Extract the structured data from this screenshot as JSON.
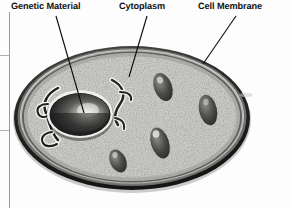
{
  "figure": {
    "kind": "cell-diagram",
    "medium": "grayscale scanned textbook illustration",
    "background_color": "#fdfdfd"
  },
  "labels": [
    {
      "id": "genetic-material",
      "text": "Genetic Material",
      "x": 11,
      "y": 2,
      "leader": {
        "from_x": 56,
        "from_y": 16,
        "to_x": 84,
        "to_y": 113
      }
    },
    {
      "id": "cytoplasm",
      "text": "Cytoplasm",
      "x": 119,
      "y": 2,
      "leader": {
        "from_x": 147,
        "from_y": 16,
        "to_x": 129,
        "to_y": 77
      }
    },
    {
      "id": "cell-membrane",
      "text": "Cell Membrane",
      "x": 198,
      "y": 2,
      "leader": {
        "from_x": 236,
        "from_y": 16,
        "to_x": 203,
        "to_y": 64
      }
    }
  ],
  "structures": {
    "cell_body": {
      "name": "cell",
      "cx": 132,
      "cy": 118,
      "rx": 118,
      "ry": 73,
      "membrane_color": "#2b2b2b",
      "cytoplasm_color": "#b9b9b6"
    },
    "nucleus": {
      "name": "nucleus",
      "cx": 80,
      "cy": 114,
      "rx": 31,
      "ry": 22,
      "color": "#3a3a3a",
      "highlight_color": "#e8e8e4"
    },
    "er_left": {
      "name": "endoplasmic-reticulum-left",
      "cx": 46,
      "cy": 120
    },
    "er_right": {
      "name": "endoplasmic-reticulum-right",
      "cx": 117,
      "cy": 105
    },
    "organelles": [
      {
        "name": "mitochondrion",
        "cx": 163,
        "cy": 87,
        "rx": 9,
        "ry": 14,
        "rot": -20
      },
      {
        "name": "mitochondrion",
        "cx": 208,
        "cy": 110,
        "rx": 9,
        "ry": 15,
        "rot": -12
      },
      {
        "name": "mitochondrion",
        "cx": 160,
        "cy": 143,
        "rx": 9,
        "ry": 16,
        "rot": -18
      },
      {
        "name": "mitochondrion",
        "cx": 118,
        "cy": 160,
        "rx": 8,
        "ry": 12,
        "rot": -25
      }
    ]
  },
  "page_border": {
    "name": "page-margin-rule",
    "x": 9,
    "y_top": 12,
    "y_bottom": 208,
    "color": "#9a9a9a",
    "ticks": [
      {
        "y": 55
      },
      {
        "y": 130
      }
    ]
  }
}
